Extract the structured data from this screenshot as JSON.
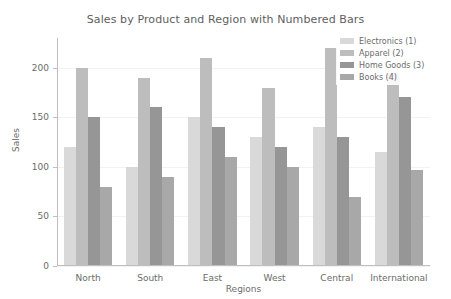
{
  "chart_data": {
    "type": "bar",
    "title": "Sales by Product and Region with Numbered Bars",
    "xlabel": "Regions",
    "ylabel": "Sales",
    "categories": [
      "North",
      "South",
      "East",
      "West",
      "Central",
      "International"
    ],
    "series": [
      {
        "name": "Electronics (1)",
        "color": "#d9d9d9",
        "values": [
          120,
          100,
          150,
          130,
          140,
          115
        ]
      },
      {
        "name": "Apparel (2)",
        "color": "#bdbdbd",
        "values": [
          200,
          190,
          210,
          180,
          220,
          195
        ]
      },
      {
        "name": "Home Goods (3)",
        "color": "#969696",
        "values": [
          150,
          160,
          140,
          120,
          130,
          170
        ]
      },
      {
        "name": "Books (4)",
        "color": "#a8a8a8",
        "values": [
          80,
          90,
          110,
          100,
          70,
          97
        ]
      }
    ],
    "ylim": [
      0,
      230
    ],
    "yticks": [
      0,
      50,
      100,
      150,
      200
    ],
    "ytick_labels": [
      "0",
      "50",
      "100",
      "150",
      "200"
    ],
    "grid": false,
    "legend_position": "upper right"
  }
}
